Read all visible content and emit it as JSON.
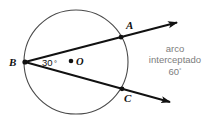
{
  "figure": {
    "type": "geometry-diagram",
    "background_color": "#ffffff",
    "stroke_color": "#111111",
    "circle_color": "#4a4a4a",
    "caption_color": "#7d7d7d"
  },
  "circle": {
    "center_label": "O",
    "center_x": 76,
    "center_y": 62,
    "radius": 52
  },
  "points": [
    {
      "label": "A",
      "x": 121,
      "y": 38,
      "label_x": 126,
      "label_y": 29
    },
    {
      "label": "B",
      "x": 25,
      "y": 62,
      "label_x": 9,
      "label_y": 66
    },
    {
      "label": "C",
      "x": 122,
      "y": 87,
      "label_x": 124,
      "label_y": 102
    }
  ],
  "angle": {
    "vertex": "B",
    "value": "30",
    "degree_symbol": "°",
    "label": "30°",
    "label_x": 42,
    "label_y": 66
  },
  "caption": {
    "line1": "arco",
    "line2": "interceptado",
    "line3_value": "60",
    "line3_degree": "°"
  },
  "rays": [
    {
      "name": "ray-BA",
      "from": "B",
      "through": "A",
      "arrow": true
    },
    {
      "name": "ray-BC",
      "from": "B",
      "through": "C",
      "arrow": true
    }
  ]
}
